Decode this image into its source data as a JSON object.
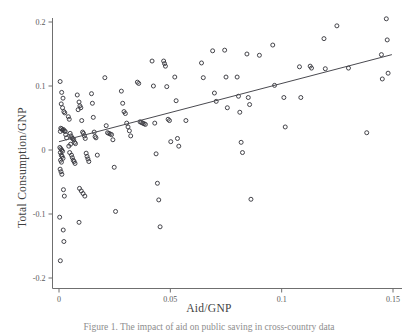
{
  "figure": {
    "background_color": "#ffffff",
    "axis_color": "#6f6f6f",
    "marker_color": "#3a3a40",
    "line_color": "#4a4a50"
  },
  "caption": {
    "text": "Figure 1. The impact of aid on public saving in cross-country data"
  },
  "chart_data": {
    "type": "scatter",
    "title": "",
    "xlabel": "Aid/GNP",
    "ylabel": "Total Consumption/GNP",
    "xlim": [
      -0.004,
      0.152
    ],
    "ylim": [
      -0.215,
      0.215
    ],
    "xticks": [
      0,
      0.05,
      0.1,
      0.15
    ],
    "xtick_labels": [
      "0",
      "0.05",
      "0.1",
      "0.15"
    ],
    "yticks": [
      0.2,
      0.1,
      0,
      -0.1,
      -0.2
    ],
    "ytick_labels": [
      "0.2",
      "0.1",
      "0",
      "-0.1",
      "-0.2"
    ],
    "grid": false,
    "legend": null,
    "marker": "open-circle",
    "marker_size": 4,
    "series": [
      {
        "name": "countries",
        "points": [
          [
            0.0005,
            0.107
          ],
          [
            0.0012,
            0.09
          ],
          [
            0.0018,
            0.081
          ],
          [
            0.001,
            0.072
          ],
          [
            0.0016,
            0.066
          ],
          [
            0.0022,
            0.06
          ],
          [
            0.0026,
            0.058
          ],
          [
            0.0008,
            0.034
          ],
          [
            0.0012,
            0.033
          ],
          [
            0.0016,
            0.031
          ],
          [
            0.002,
            0.032
          ],
          [
            0.0024,
            0.03
          ],
          [
            0.0028,
            0.029
          ],
          [
            0.0006,
            0.029
          ],
          [
            0.003,
            0.024
          ],
          [
            0.0034,
            0.019
          ],
          [
            0.0004,
            0.004
          ],
          [
            0.0008,
            0.002
          ],
          [
            0.0012,
            0.0
          ],
          [
            0.0016,
            -0.002
          ],
          [
            0.0006,
            -0.004
          ],
          [
            0.001,
            -0.008
          ],
          [
            0.0014,
            -0.01
          ],
          [
            0.0018,
            -0.013
          ],
          [
            0.0007,
            -0.016
          ],
          [
            0.0011,
            -0.019
          ],
          [
            0.0005,
            -0.03
          ],
          [
            0.0009,
            -0.034
          ],
          [
            0.0013,
            -0.038
          ],
          [
            0.002,
            -0.062
          ],
          [
            0.0024,
            -0.072
          ],
          [
            0.0003,
            -0.105
          ],
          [
            0.0019,
            -0.125
          ],
          [
            0.0022,
            -0.143
          ],
          [
            0.0006,
            -0.173
          ],
          [
            0.0042,
            0.052
          ],
          [
            0.0046,
            0.048
          ],
          [
            0.005,
            0.026
          ],
          [
            0.0054,
            0.022
          ],
          [
            0.0058,
            0.019
          ],
          [
            0.0062,
            0.018
          ],
          [
            0.0066,
            0.016
          ],
          [
            0.007,
            0.012
          ],
          [
            0.0074,
            0.01
          ],
          [
            0.0052,
            0.009
          ],
          [
            0.0044,
            0.006
          ],
          [
            0.0048,
            -0.004
          ],
          [
            0.0056,
            -0.008
          ],
          [
            0.006,
            -0.012
          ],
          [
            0.0064,
            -0.016
          ],
          [
            0.0068,
            -0.018
          ],
          [
            0.0072,
            -0.021
          ],
          [
            0.0082,
            0.086
          ],
          [
            0.009,
            0.075
          ],
          [
            0.0094,
            0.069
          ],
          [
            0.0098,
            0.066
          ],
          [
            0.0086,
            0.063
          ],
          [
            0.0102,
            0.046
          ],
          [
            0.0106,
            0.028
          ],
          [
            0.011,
            0.026
          ],
          [
            0.0114,
            0.022
          ],
          [
            0.0118,
            0.018
          ],
          [
            0.0122,
            -0.005
          ],
          [
            0.0126,
            -0.01
          ],
          [
            0.013,
            -0.014
          ],
          [
            0.0134,
            -0.018
          ],
          [
            0.0092,
            -0.06
          ],
          [
            0.01,
            -0.064
          ],
          [
            0.0108,
            -0.068
          ],
          [
            0.0116,
            -0.072
          ],
          [
            0.009,
            -0.113
          ],
          [
            0.0146,
            0.088
          ],
          [
            0.015,
            0.073
          ],
          [
            0.0154,
            0.051
          ],
          [
            0.0158,
            0.028
          ],
          [
            0.0162,
            0.021
          ],
          [
            0.0166,
            0.019
          ],
          [
            0.0172,
            -0.008
          ],
          [
            0.0206,
            0.113
          ],
          [
            0.0212,
            0.038
          ],
          [
            0.0218,
            0.027
          ],
          [
            0.0224,
            0.026
          ],
          [
            0.023,
            0.025
          ],
          [
            0.0236,
            0.024
          ],
          [
            0.0242,
            0.016
          ],
          [
            0.0248,
            -0.027
          ],
          [
            0.0254,
            -0.096
          ],
          [
            0.028,
            0.092
          ],
          [
            0.0286,
            0.073
          ],
          [
            0.0292,
            0.06
          ],
          [
            0.0298,
            0.057
          ],
          [
            0.0304,
            0.042
          ],
          [
            0.031,
            0.036
          ],
          [
            0.0316,
            0.03
          ],
          [
            0.0322,
            0.022
          ],
          [
            0.0352,
            0.106
          ],
          [
            0.0358,
            0.104
          ],
          [
            0.0364,
            0.044
          ],
          [
            0.037,
            0.043
          ],
          [
            0.0376,
            0.042
          ],
          [
            0.0382,
            0.041
          ],
          [
            0.0388,
            0.04
          ],
          [
            0.0418,
            0.139
          ],
          [
            0.0424,
            0.1
          ],
          [
            0.043,
            0.042
          ],
          [
            0.0436,
            -0.006
          ],
          [
            0.0442,
            -0.052
          ],
          [
            0.0448,
            -0.078
          ],
          [
            0.0454,
            -0.12
          ],
          [
            0.047,
            0.139
          ],
          [
            0.0474,
            0.135
          ],
          [
            0.0478,
            0.131
          ],
          [
            0.0484,
            0.099
          ],
          [
            0.049,
            0.048
          ],
          [
            0.0496,
            0.046
          ],
          [
            0.0502,
            0.013
          ],
          [
            0.052,
            0.114
          ],
          [
            0.0526,
            0.077
          ],
          [
            0.0532,
            0.018
          ],
          [
            0.0538,
            0.006
          ],
          [
            0.057,
            0.046
          ],
          [
            0.064,
            0.136
          ],
          [
            0.0648,
            0.113
          ],
          [
            0.069,
            0.155
          ],
          [
            0.0698,
            0.089
          ],
          [
            0.0706,
            0.076
          ],
          [
            0.0744,
            0.156
          ],
          [
            0.075,
            0.114
          ],
          [
            0.0756,
            0.066
          ],
          [
            0.08,
            0.114
          ],
          [
            0.0806,
            0.084
          ],
          [
            0.0812,
            0.059
          ],
          [
            0.0818,
            0.012
          ],
          [
            0.0824,
            -0.004
          ],
          [
            0.0844,
            0.15
          ],
          [
            0.085,
            0.082
          ],
          [
            0.0856,
            0.071
          ],
          [
            0.0862,
            -0.077
          ],
          [
            0.09,
            0.148
          ],
          [
            0.096,
            0.164
          ],
          [
            0.0968,
            0.101
          ],
          [
            0.101,
            0.082
          ],
          [
            0.1016,
            0.036
          ],
          [
            0.108,
            0.13
          ],
          [
            0.1086,
            0.082
          ],
          [
            0.1128,
            0.131
          ],
          [
            0.1134,
            0.128
          ],
          [
            0.119,
            0.174
          ],
          [
            0.1196,
            0.127
          ],
          [
            0.1248,
            0.194
          ],
          [
            0.13,
            0.128
          ],
          [
            0.1382,
            0.027
          ],
          [
            0.1448,
            0.149
          ],
          [
            0.1452,
            0.111
          ],
          [
            0.147,
            0.205
          ],
          [
            0.1474,
            0.172
          ],
          [
            0.1478,
            0.12
          ]
        ]
      }
    ],
    "fit_line": {
      "name": "regression-line",
      "x_start": 0.0,
      "y_start": 0.013,
      "x_end": 0.1495,
      "y_end": 0.149
    }
  }
}
